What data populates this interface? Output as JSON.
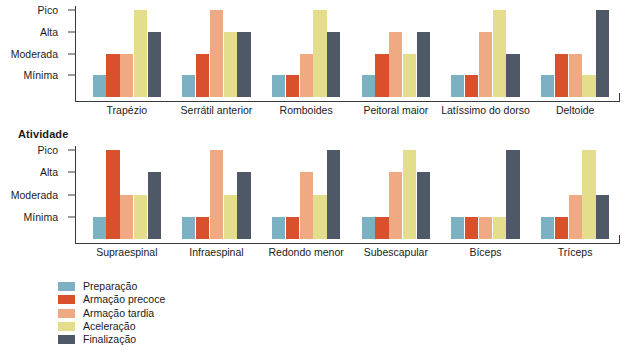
{
  "sections": {
    "bottom_heading": "Atividade"
  },
  "legend": {
    "position": "bottom-left",
    "items": [
      {
        "label": "Preparação",
        "color": "#7cb1c4"
      },
      {
        "label": "Armação precoce",
        "color": "#d9512c"
      },
      {
        "label": "Armação tardia",
        "color": "#efa983"
      },
      {
        "label": "Aceleração",
        "color": "#e4dd8c"
      },
      {
        "label": "Finalização",
        "color": "#4f5867"
      }
    ]
  },
  "chart_data": [
    {
      "id": "top",
      "type": "bar",
      "title": "",
      "xlabel": "",
      "ylabel": "",
      "grid": false,
      "legend_position": "bottom-left",
      "ytick_labels": [
        "Mínima",
        "Moderada",
        "Alta",
        "Pico"
      ],
      "ylim": [
        0,
        4
      ],
      "categories": [
        "Trapézio",
        "Serrátil anterior",
        "Romboides",
        "Peitoral maior",
        "Latíssimo do dorso",
        "Deltoide"
      ],
      "series": [
        {
          "name": "Preparação",
          "color": "#7cb1c4",
          "values": [
            1,
            1,
            1,
            1,
            1,
            1
          ],
          "levels": [
            "Mínima",
            "Mínima",
            "Mínima",
            "Mínima",
            "Mínima",
            "Mínima"
          ]
        },
        {
          "name": "Armação precoce",
          "color": "#d9512c",
          "values": [
            2,
            2,
            1,
            2,
            1,
            2
          ],
          "levels": [
            "Moderada",
            "Moderada",
            "Mínima",
            "Moderada",
            "Mínima",
            "Moderada"
          ]
        },
        {
          "name": "Armação tardia",
          "color": "#efa983",
          "values": [
            2,
            4,
            2,
            3,
            3,
            2
          ],
          "levels": [
            "Moderada",
            "Pico",
            "Moderada",
            "Alta",
            "Alta",
            "Moderada"
          ]
        },
        {
          "name": "Aceleração",
          "color": "#e4dd8c",
          "values": [
            4,
            3,
            4,
            2,
            4,
            1
          ],
          "levels": [
            "Pico",
            "Alta",
            "Pico",
            "Moderada",
            "Pico",
            "Mínima"
          ]
        },
        {
          "name": "Finalização",
          "color": "#4f5867",
          "values": [
            3,
            3,
            3,
            3,
            2,
            4
          ],
          "levels": [
            "Alta",
            "Alta",
            "Alta",
            "Alta",
            "Moderada",
            "Pico"
          ]
        }
      ]
    },
    {
      "id": "bottom",
      "type": "bar",
      "title": "Atividade",
      "xlabel": "",
      "ylabel": "",
      "grid": false,
      "legend_position": "bottom-left",
      "ytick_labels": [
        "Mínima",
        "Moderada",
        "Alta",
        "Pico"
      ],
      "ylim": [
        0,
        4
      ],
      "categories": [
        "Supraespinal",
        "Infraespinal",
        "Redondo menor",
        "Subescapular",
        "Bíceps",
        "Tríceps"
      ],
      "series": [
        {
          "name": "Preparação",
          "color": "#7cb1c4",
          "values": [
            1,
            1,
            1,
            1,
            1,
            1
          ],
          "levels": [
            "Mínima",
            "Mínima",
            "Mínima",
            "Mínima",
            "Mínima",
            "Mínima"
          ]
        },
        {
          "name": "Armação precoce",
          "color": "#d9512c",
          "values": [
            4,
            1,
            1,
            1,
            1,
            1
          ],
          "levels": [
            "Pico",
            "Mínima",
            "Mínima",
            "Mínima",
            "Mínima",
            "Mínima"
          ]
        },
        {
          "name": "Armação tardia",
          "color": "#efa983",
          "values": [
            2,
            4,
            3,
            3,
            1,
            2
          ],
          "levels": [
            "Moderada",
            "Pico",
            "Alta",
            "Alta",
            "Mínima",
            "Moderada"
          ]
        },
        {
          "name": "Aceleração",
          "color": "#e4dd8c",
          "values": [
            2,
            2,
            2,
            4,
            1,
            4
          ],
          "levels": [
            "Moderada",
            "Moderada",
            "Moderada",
            "Pico",
            "Mínima",
            "Pico"
          ]
        },
        {
          "name": "Finalização",
          "color": "#4f5867",
          "values": [
            3,
            3,
            4,
            3,
            4,
            2
          ],
          "levels": [
            "Alta",
            "Alta",
            "Pico",
            "Alta",
            "Pico",
            "Moderada"
          ]
        }
      ]
    }
  ]
}
